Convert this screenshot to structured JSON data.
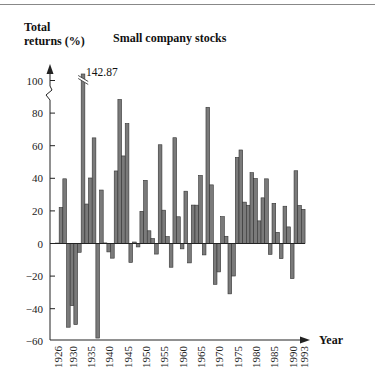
{
  "chart_data": {
    "type": "bar",
    "title": "Small company stocks",
    "ylabel": "Total returns (%)",
    "xlabel": "Year",
    "ylim": [
      -60,
      100
    ],
    "yticks": [
      100,
      80,
      60,
      40,
      20,
      0,
      -20,
      -40,
      -60
    ],
    "xticks": [
      "1926",
      "1930",
      "1935",
      "1940",
      "1945",
      "1950",
      "1955",
      "1960",
      "1965",
      "1970",
      "1975",
      "1980",
      "1985",
      "1990",
      "1993"
    ],
    "annotations": [
      {
        "year": 1933,
        "text": "142.87",
        "note": "bar truncated with axis break"
      }
    ],
    "grid": false,
    "legend": "none",
    "categories": [
      1926,
      1927,
      1928,
      1929,
      1930,
      1931,
      1932,
      1933,
      1934,
      1935,
      1936,
      1937,
      1938,
      1939,
      1940,
      1941,
      1942,
      1943,
      1944,
      1945,
      1946,
      1947,
      1948,
      1949,
      1950,
      1951,
      1952,
      1953,
      1954,
      1955,
      1956,
      1957,
      1958,
      1959,
      1960,
      1961,
      1962,
      1963,
      1964,
      1965,
      1966,
      1967,
      1968,
      1969,
      1970,
      1971,
      1972,
      1973,
      1974,
      1975,
      1976,
      1977,
      1978,
      1979,
      1980,
      1981,
      1982,
      1983,
      1984,
      1985,
      1986,
      1987,
      1988,
      1989,
      1990,
      1991,
      1992,
      1993
    ],
    "values": [
      0.28,
      22.1,
      39.69,
      -51.36,
      -38.15,
      -49.75,
      -5.39,
      142.87,
      24.22,
      40.19,
      64.8,
      -58.01,
      32.8,
      0.35,
      -5.16,
      -9.0,
      44.51,
      88.37,
      53.72,
      73.61,
      -11.63,
      0.92,
      -2.11,
      19.75,
      38.75,
      7.8,
      3.03,
      -6.49,
      60.58,
      20.44,
      4.28,
      -14.57,
      64.89,
      16.4,
      -3.29,
      32.09,
      -11.9,
      23.57,
      23.52,
      41.75,
      -7.01,
      83.57,
      35.97,
      -25.05,
      -17.43,
      16.5,
      4.43,
      -30.9,
      -19.95,
      52.82,
      57.38,
      25.38,
      23.46,
      43.46,
      39.88,
      13.88,
      28.01,
      39.67,
      -6.67,
      24.66,
      6.85,
      -9.3,
      22.87,
      10.18,
      -21.56,
      44.63,
      23.35,
      20.98
    ]
  },
  "labels": {
    "ylabel_line1": "Total",
    "ylabel_line2": "returns (%)",
    "title": "Small company stocks",
    "xlabel": "Year",
    "annotation": "142.87"
  },
  "style": {
    "bar_fill": "#7a7a7a",
    "bar_stroke": "#333333",
    "axis_color": "#222222"
  }
}
